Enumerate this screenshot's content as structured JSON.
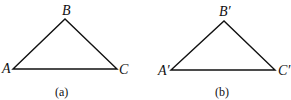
{
  "figures": [
    {
      "caption": "(a)",
      "vertices": {
        "A": "A",
        "B": "B",
        "C": "C"
      }
    },
    {
      "caption": "(b)",
      "vertices": {
        "A": "A′",
        "B": "B′",
        "C": "C′"
      }
    }
  ],
  "colors": {
    "stroke": "#111111",
    "background": "#ffffff"
  }
}
